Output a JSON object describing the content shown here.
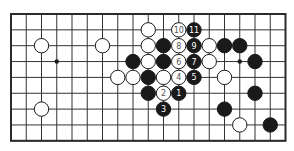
{
  "diagram": {
    "type": "go-board-fragment",
    "columns": 19,
    "rows": 9,
    "origin_px": [
      11,
      14
    ],
    "spacing_px": [
      15.25,
      15.85
    ],
    "stone_radius_px": 7.2,
    "colors": {
      "line": "#333333",
      "frame": "#2a2a2a",
      "black": "#1a1a1a",
      "white": "#ffffff",
      "black_label": "#ffffff",
      "white_label": "#555555"
    },
    "hoshi": [
      {
        "col": 3,
        "row": 3
      },
      {
        "col": 15,
        "row": 3
      }
    ],
    "stones": [
      {
        "color": "white",
        "col": 2,
        "row": 2,
        "label": ""
      },
      {
        "color": "white",
        "col": 6,
        "row": 2,
        "label": ""
      },
      {
        "color": "white",
        "col": 2,
        "row": 6,
        "label": ""
      },
      {
        "color": "black",
        "col": 8,
        "row": 3,
        "label": ""
      },
      {
        "color": "white",
        "col": 7,
        "row": 4,
        "label": ""
      },
      {
        "color": "white",
        "col": 8,
        "row": 4,
        "label": ""
      },
      {
        "color": "white",
        "col": 9,
        "row": 1,
        "label": ""
      },
      {
        "color": "white",
        "col": 9,
        "row": 2,
        "label": ""
      },
      {
        "color": "white",
        "col": 9,
        "row": 3,
        "label": ""
      },
      {
        "color": "black",
        "col": 9,
        "row": 4,
        "label": ""
      },
      {
        "color": "black",
        "col": 9,
        "row": 5,
        "label": ""
      },
      {
        "color": "white",
        "col": 11,
        "row": 1,
        "label": "10"
      },
      {
        "color": "black",
        "col": 12,
        "row": 1,
        "label": "11"
      },
      {
        "color": "black",
        "col": 10,
        "row": 2,
        "label": ""
      },
      {
        "color": "white",
        "col": 11,
        "row": 2,
        "label": "8"
      },
      {
        "color": "black",
        "col": 12,
        "row": 2,
        "label": "9"
      },
      {
        "color": "white",
        "col": 13,
        "row": 2,
        "label": ""
      },
      {
        "color": "black",
        "col": 14,
        "row": 2,
        "label": ""
      },
      {
        "color": "black",
        "col": 15,
        "row": 2,
        "label": ""
      },
      {
        "color": "black",
        "col": 10,
        "row": 3,
        "label": ""
      },
      {
        "color": "white",
        "col": 11,
        "row": 3,
        "label": "6"
      },
      {
        "color": "black",
        "col": 12,
        "row": 3,
        "label": "7"
      },
      {
        "color": "white",
        "col": 13,
        "row": 3,
        "label": ""
      },
      {
        "color": "black",
        "col": 16,
        "row": 3,
        "label": ""
      },
      {
        "color": "white",
        "col": 10,
        "row": 4,
        "label": ""
      },
      {
        "color": "white",
        "col": 11,
        "row": 4,
        "label": "4"
      },
      {
        "color": "black",
        "col": 12,
        "row": 4,
        "label": "5"
      },
      {
        "color": "white",
        "col": 14,
        "row": 4,
        "label": ""
      },
      {
        "color": "white",
        "col": 10,
        "row": 5,
        "label": "2"
      },
      {
        "color": "black",
        "col": 11,
        "row": 5,
        "label": "1"
      },
      {
        "color": "black",
        "col": 16,
        "row": 5,
        "label": ""
      },
      {
        "color": "black",
        "col": 10,
        "row": 6,
        "label": "3"
      },
      {
        "color": "black",
        "col": 14,
        "row": 6,
        "label": ""
      },
      {
        "color": "white",
        "col": 15,
        "row": 7,
        "label": ""
      },
      {
        "color": "black",
        "col": 17,
        "row": 7,
        "label": ""
      }
    ]
  }
}
